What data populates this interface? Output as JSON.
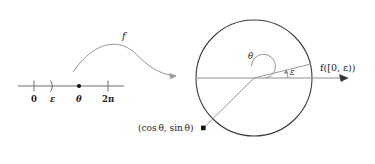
{
  "figure": {
    "colors": {
      "line": "#6e6e6e",
      "circle": "#3d3d3d",
      "radius": "#8a8a8a",
      "text": "#1d1d1d",
      "point": "#111111"
    }
  },
  "number_line": {
    "name": "real-number-line",
    "ticks": [
      {
        "label": "0",
        "kind": "tick",
        "x": 34
      },
      {
        "label": "ε",
        "kind": "paren-right",
        "x": 53
      },
      {
        "label": "θ",
        "kind": "dot",
        "x": 79
      },
      {
        "label": "2π",
        "kind": "tick",
        "x": 108
      }
    ],
    "zero_label": "0",
    "epsilon_label": "ε",
    "theta_label": "θ",
    "twopi_label": "2π"
  },
  "map_arrow": {
    "name": "map-arrow",
    "label": "f"
  },
  "circle": {
    "name": "unit-circle",
    "center_x": 254,
    "center_y": 78,
    "radius": 58,
    "theta_label": "θ",
    "epsilon_label": "ε",
    "point_label": "(cos θ, sin θ)",
    "image_label": "f([0, ε))"
  }
}
